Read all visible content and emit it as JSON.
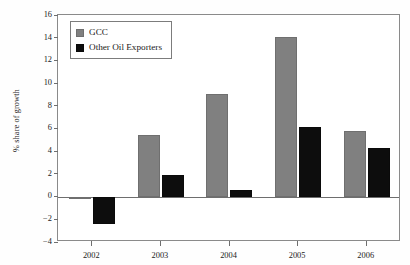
{
  "chart_data": {
    "type": "bar",
    "title": "",
    "subtitle": "",
    "xlabel": "",
    "ylabel": "% share of growth",
    "categories": [
      "2002",
      "2003",
      "2004",
      "2005",
      "2006"
    ],
    "series": [
      {
        "name": "GCC",
        "color": "#808080",
        "values": [
          -0.2,
          5.4,
          9.0,
          14.1,
          5.8
        ]
      },
      {
        "name": "Other Oil Exporters",
        "color": "#0d0d0d",
        "values": [
          -2.4,
          1.9,
          0.6,
          6.1,
          4.3
        ]
      }
    ],
    "ylim": [
      -4,
      16
    ],
    "ytick_labels": [
      "16",
      "14",
      "12",
      "10",
      "8",
      "6",
      "4",
      "2",
      "0",
      "-2",
      "-4"
    ],
    "ytick_values": [
      16,
      14,
      12,
      10,
      8,
      6,
      4,
      2,
      0,
      -2,
      -4
    ],
    "grid": false,
    "legend_position": "top-left-inside",
    "zero_line": 0
  },
  "legend": {
    "entries": [
      {
        "label": "GCC",
        "swatch": "gcc"
      },
      {
        "label": "Other Oil Exporters",
        "swatch": "other"
      }
    ]
  }
}
